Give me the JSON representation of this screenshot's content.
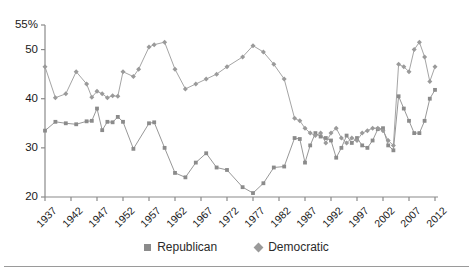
{
  "chart_data": {
    "type": "line",
    "title": "",
    "subtitle": "",
    "xlabel": "",
    "ylabel": "",
    "grid": false,
    "legend_position": "bottom-center",
    "ylim": [
      20,
      55
    ],
    "yticks": [
      20,
      30,
      40,
      50,
      55
    ],
    "ytick_labels": [
      "20",
      "30",
      "40",
      "50",
      "55%"
    ],
    "xlim": [
      1937,
      2012
    ],
    "xticks": [
      1937,
      1942,
      1947,
      1952,
      1957,
      1962,
      1967,
      1972,
      1977,
      1982,
      1987,
      1992,
      1997,
      2002,
      2007,
      2012
    ],
    "xtick_labels": [
      "1937",
      "1942",
      "1947",
      "1952",
      "1957",
      "1962",
      "1967",
      "1972",
      "1977",
      "1982",
      "1987",
      "1992",
      "1997",
      "2002",
      "2007",
      "2012"
    ],
    "colors": {
      "republican": "#8b8b8b",
      "democratic": "#9a9a9a",
      "axis": "#8a8a8a",
      "text": "#1a1a1a"
    },
    "series": [
      {
        "name": "Republican",
        "marker": "square",
        "color": "#8b8b8b",
        "points": [
          {
            "x": 1937,
            "y": 33.5
          },
          {
            "x": 1939,
            "y": 35.3
          },
          {
            "x": 1941,
            "y": 35.0
          },
          {
            "x": 1943,
            "y": 34.8
          },
          {
            "x": 1945,
            "y": 35.4
          },
          {
            "x": 1946,
            "y": 35.5
          },
          {
            "x": 1947,
            "y": 38.0
          },
          {
            "x": 1948,
            "y": 33.6
          },
          {
            "x": 1949,
            "y": 35.3
          },
          {
            "x": 1950,
            "y": 35.2
          },
          {
            "x": 1951,
            "y": 36.3
          },
          {
            "x": 1952,
            "y": 35.3
          },
          {
            "x": 1954,
            "y": 29.8
          },
          {
            "x": 1957,
            "y": 35.0
          },
          {
            "x": 1958,
            "y": 35.2
          },
          {
            "x": 1960,
            "y": 30.0
          },
          {
            "x": 1962,
            "y": 24.9
          },
          {
            "x": 1964,
            "y": 24.0
          },
          {
            "x": 1966,
            "y": 27.0
          },
          {
            "x": 1968,
            "y": 28.9
          },
          {
            "x": 1970,
            "y": 26.0
          },
          {
            "x": 1972,
            "y": 25.5
          },
          {
            "x": 1975,
            "y": 22.0
          },
          {
            "x": 1977,
            "y": 20.8
          },
          {
            "x": 1979,
            "y": 22.8
          },
          {
            "x": 1981,
            "y": 26.0
          },
          {
            "x": 1983,
            "y": 26.2
          },
          {
            "x": 1985,
            "y": 32.0
          },
          {
            "x": 1986,
            "y": 31.8
          },
          {
            "x": 1987,
            "y": 27.0
          },
          {
            "x": 1988,
            "y": 30.5
          },
          {
            "x": 1989,
            "y": 33.0
          },
          {
            "x": 1990,
            "y": 32.3
          },
          {
            "x": 1991,
            "y": 32.0
          },
          {
            "x": 1992,
            "y": 31.5
          },
          {
            "x": 1993,
            "y": 28.0
          },
          {
            "x": 1994,
            "y": 30.0
          },
          {
            "x": 1995,
            "y": 32.5
          },
          {
            "x": 1996,
            "y": 31.0
          },
          {
            "x": 1997,
            "y": 32.0
          },
          {
            "x": 1998,
            "y": 30.5
          },
          {
            "x": 1999,
            "y": 30.0
          },
          {
            "x": 2000,
            "y": 31.5
          },
          {
            "x": 2001,
            "y": 33.8
          },
          {
            "x": 2002,
            "y": 34.0
          },
          {
            "x": 2003,
            "y": 30.5
          },
          {
            "x": 2004,
            "y": 29.5
          },
          {
            "x": 2005,
            "y": 40.5
          },
          {
            "x": 2006,
            "y": 38.0
          },
          {
            "x": 2007,
            "y": 35.5
          },
          {
            "x": 2008,
            "y": 33.0
          },
          {
            "x": 2009,
            "y": 33.0
          },
          {
            "x": 2010,
            "y": 35.5
          },
          {
            "x": 2011,
            "y": 40.0
          },
          {
            "x": 2012,
            "y": 41.8
          }
        ]
      },
      {
        "name": "Democratic",
        "marker": "diamond",
        "color": "#9a9a9a",
        "points": [
          {
            "x": 1937,
            "y": 46.5
          },
          {
            "x": 1939,
            "y": 40.2
          },
          {
            "x": 1941,
            "y": 41.0
          },
          {
            "x": 1943,
            "y": 45.5
          },
          {
            "x": 1945,
            "y": 43.0
          },
          {
            "x": 1946,
            "y": 40.3
          },
          {
            "x": 1947,
            "y": 41.5
          },
          {
            "x": 1948,
            "y": 41.0
          },
          {
            "x": 1949,
            "y": 40.2
          },
          {
            "x": 1950,
            "y": 40.6
          },
          {
            "x": 1951,
            "y": 40.5
          },
          {
            "x": 1952,
            "y": 45.5
          },
          {
            "x": 1954,
            "y": 44.5
          },
          {
            "x": 1955,
            "y": 46.0
          },
          {
            "x": 1957,
            "y": 50.5
          },
          {
            "x": 1958,
            "y": 51.0
          },
          {
            "x": 1960,
            "y": 51.5
          },
          {
            "x": 1962,
            "y": 46.0
          },
          {
            "x": 1964,
            "y": 42.0
          },
          {
            "x": 1966,
            "y": 43.0
          },
          {
            "x": 1968,
            "y": 44.0
          },
          {
            "x": 1970,
            "y": 45.0
          },
          {
            "x": 1972,
            "y": 46.5
          },
          {
            "x": 1975,
            "y": 48.5
          },
          {
            "x": 1977,
            "y": 50.8
          },
          {
            "x": 1979,
            "y": 49.5
          },
          {
            "x": 1981,
            "y": 47.0
          },
          {
            "x": 1983,
            "y": 44.0
          },
          {
            "x": 1985,
            "y": 36.0
          },
          {
            "x": 1986,
            "y": 35.5
          },
          {
            "x": 1987,
            "y": 34.0
          },
          {
            "x": 1988,
            "y": 33.0
          },
          {
            "x": 1989,
            "y": 32.5
          },
          {
            "x": 1990,
            "y": 33.0
          },
          {
            "x": 1991,
            "y": 31.0
          },
          {
            "x": 1992,
            "y": 33.0
          },
          {
            "x": 1993,
            "y": 34.0
          },
          {
            "x": 1994,
            "y": 32.0
          },
          {
            "x": 1995,
            "y": 31.0
          },
          {
            "x": 1996,
            "y": 32.0
          },
          {
            "x": 1997,
            "y": 31.5
          },
          {
            "x": 1998,
            "y": 33.0
          },
          {
            "x": 1999,
            "y": 33.5
          },
          {
            "x": 2000,
            "y": 34.0
          },
          {
            "x": 2001,
            "y": 34.0
          },
          {
            "x": 2002,
            "y": 33.5
          },
          {
            "x": 2003,
            "y": 31.5
          },
          {
            "x": 2004,
            "y": 30.5
          },
          {
            "x": 2005,
            "y": 47.0
          },
          {
            "x": 2006,
            "y": 46.5
          },
          {
            "x": 2007,
            "y": 45.5
          },
          {
            "x": 2008,
            "y": 50.0
          },
          {
            "x": 2009,
            "y": 51.5
          },
          {
            "x": 2010,
            "y": 48.5
          },
          {
            "x": 2011,
            "y": 43.5
          },
          {
            "x": 2012,
            "y": 46.5
          }
        ]
      }
    ]
  },
  "legend": {
    "entries": [
      {
        "label": "Republican",
        "marker": "square"
      },
      {
        "label": "Democratic",
        "marker": "diamond"
      }
    ]
  }
}
